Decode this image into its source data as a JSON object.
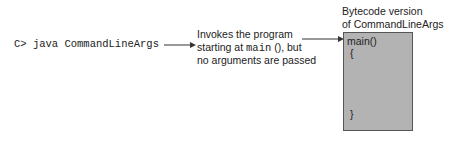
{
  "command": {
    "prompt": "C>",
    "text": "java CommandLineArgs"
  },
  "description": {
    "line1": "Invokes the program",
    "line2_prefix": "starting at ",
    "line2_code": "main",
    "line2_suffix": " (), but",
    "line3": "no arguments are passed"
  },
  "bytecode": {
    "title_line1": "Bytecode version",
    "title_line2": "of CommandLineArgs",
    "lines": [
      "main()",
      "{",
      "}"
    ],
    "box_color": "#b3b3b3"
  }
}
